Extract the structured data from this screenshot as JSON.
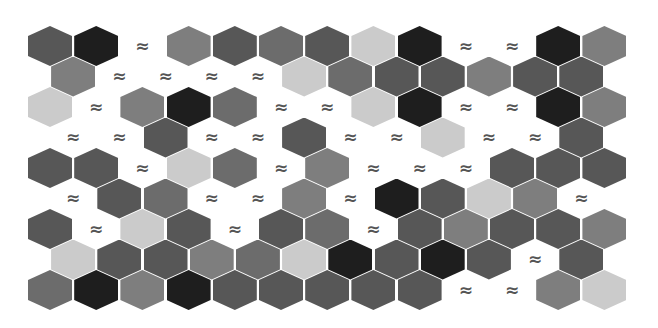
{
  "board": {
    "width": 658,
    "height": 328,
    "origin_x": 28,
    "origin_y": 26,
    "col_pitch": 46.2,
    "row_pitch": 30.5,
    "odd_row_offset": 23.1,
    "hex_width": 44,
    "hex_height": 40,
    "water_symbol": "≈",
    "water_color": "#555555",
    "palette": {
      "B": "#1e1e1e",
      "D": "#575757",
      "M": "#6c6c6c",
      "G": "#7e7e7e",
      "L": "#cbcbcb",
      "W": null
    },
    "legend": {
      "B": "black-tile",
      "D": "dark-gray-tile",
      "M": "medium-dark-gray-tile",
      "G": "medium-gray-tile",
      "L": "light-gray-tile",
      "W": "water-tile"
    },
    "rows": [
      [
        "D",
        "B",
        "W",
        "G",
        "D",
        "M",
        "D",
        "L",
        "B",
        "W",
        "W",
        "B",
        "G"
      ],
      [
        "G",
        "W",
        "W",
        "W",
        "W",
        "L",
        "M",
        "D",
        "D",
        "G",
        "D",
        "D"
      ],
      [
        "L",
        "W",
        "G",
        "B",
        "M",
        "W",
        "W",
        "L",
        "B",
        "W",
        "W",
        "B",
        "G"
      ],
      [
        "W",
        "W",
        "D",
        "W",
        "W",
        "D",
        "W",
        "W",
        "L",
        "W",
        "W",
        "D"
      ],
      [
        "D",
        "D",
        "W",
        "L",
        "M",
        "W",
        "G",
        "W",
        "W",
        "W",
        "D",
        "D",
        "D"
      ],
      [
        "W",
        "D",
        "M",
        "W",
        "W",
        "G",
        "W",
        "B",
        "D",
        "L",
        "G",
        "W"
      ],
      [
        "D",
        "W",
        "L",
        "D",
        "W",
        "D",
        "M",
        "W",
        "D",
        "G",
        "D",
        "D",
        "G"
      ],
      [
        "L",
        "D",
        "D",
        "G",
        "M",
        "L",
        "B",
        "D",
        "B",
        "D",
        "W",
        "D"
      ],
      [
        "M",
        "B",
        "G",
        "B",
        "D",
        "D",
        "D",
        "D",
        "D",
        "W",
        "W",
        "G",
        "L"
      ]
    ]
  }
}
